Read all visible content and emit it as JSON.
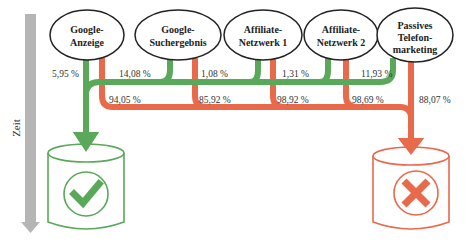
{
  "colors": {
    "success": "#5aa85a",
    "failure": "#e9694b",
    "axis": "#b5b5b5",
    "node_stroke": "#222222"
  },
  "axis": {
    "label": "Zeit"
  },
  "sources": [
    {
      "label_lines": [
        "Google-",
        "Anzeige"
      ],
      "success_pct": "5,95 %",
      "failure_pct": "94,05 %"
    },
    {
      "label_lines": [
        "Google-",
        "Suchergebnis"
      ],
      "success_pct": "14,08 %",
      "failure_pct": "85,92 %"
    },
    {
      "label_lines": [
        "Affiliate-",
        "Netzwerk 1"
      ],
      "success_pct": "1,08 %",
      "failure_pct": "98,92 %"
    },
    {
      "label_lines": [
        "Affiliate-",
        "Netzwerk 2"
      ],
      "success_pct": "1,31 %",
      "failure_pct": "98,69 %"
    },
    {
      "label_lines": [
        "Passives",
        "Telefon-",
        "marketing"
      ],
      "success_pct": "11,93 %",
      "failure_pct": "88,07 %"
    }
  ],
  "outcomes": {
    "success": {
      "icon": "check-icon"
    },
    "failure": {
      "icon": "cross-icon"
    }
  }
}
